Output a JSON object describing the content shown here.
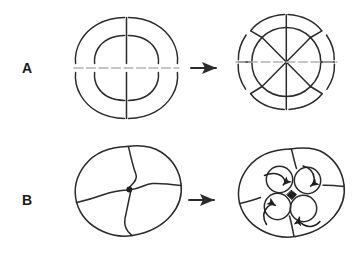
{
  "figure": {
    "background_color": "#ffffff",
    "stroke_color": "#2b2b2b",
    "equator_color": "#b3b3b3",
    "width": 360,
    "height": 269
  },
  "rows": [
    {
      "label": "A",
      "cleavage_type": "radial",
      "stages": [
        {
          "name": "four-cell-radial",
          "cell_count": 4,
          "description": "4-cell radial cleavage embryo, animal tier directly above vegetal tier"
        },
        {
          "name": "eight-cell-radial",
          "cell_count": 8,
          "description": "8-cell radial cleavage embryo, blastomeres aligned in vertical columns"
        }
      ],
      "arrow": {
        "name": "transition-arrow",
        "direction": "right"
      },
      "equator": {
        "name": "equatorial-plane-line",
        "style": "dashed-gray"
      }
    },
    {
      "label": "B",
      "cleavage_type": "spiral",
      "stages": [
        {
          "name": "four-cell-spiral",
          "cell_count": 4,
          "description": "4-cell spiral cleavage embryo, pinwheel arrangement of macromeres"
        },
        {
          "name": "eight-cell-spiral",
          "cell_count": 8,
          "description": "8-cell spiral cleavage embryo, four micromeres rotated into furrows between macromeres"
        }
      ],
      "arrow": {
        "name": "transition-arrow",
        "direction": "right"
      },
      "rotation_markers": {
        "name": "micromere-rotation-arrows",
        "count": 4,
        "description": "curved arrows on each micromere indicating direction of spiral displacement"
      }
    }
  ]
}
